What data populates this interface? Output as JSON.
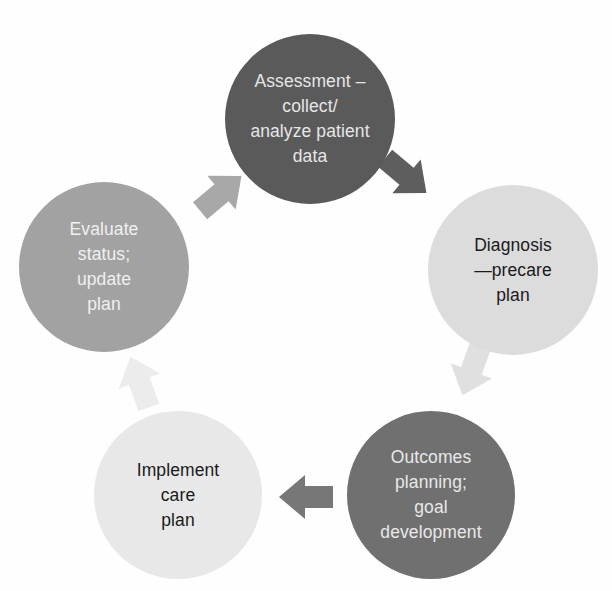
{
  "diagram": {
    "type": "cycle",
    "nodes": [
      {
        "id": "assessment",
        "lines": [
          "Assessment –",
          "collect/",
          "analyze patient",
          "data"
        ],
        "fill": "#5a5a5a",
        "text_color": "#e6e6e6",
        "cx": 310,
        "cy": 119,
        "r": 85
      },
      {
        "id": "diagnosis",
        "lines": [
          "Diagnosis",
          "—precare",
          "plan"
        ],
        "fill": "#dcdcdc",
        "text_color": "#1a1a1a",
        "cx": 513,
        "cy": 270,
        "r": 85
      },
      {
        "id": "outcomes",
        "lines": [
          "Outcomes",
          "planning;",
          "goal",
          "development"
        ],
        "fill": "#707070",
        "text_color": "#e8e8e8",
        "cx": 431,
        "cy": 495,
        "r": 84
      },
      {
        "id": "implement",
        "lines": [
          "Implement",
          "care",
          "plan"
        ],
        "fill": "#e8e8e8",
        "text_color": "#1a1a1a",
        "cx": 178,
        "cy": 495,
        "r": 84
      },
      {
        "id": "evaluate",
        "lines": [
          "Evaluate",
          "status;",
          "update",
          "plan"
        ],
        "fill": "#a2a2a2",
        "text_color": "#f0f0f0",
        "cx": 104,
        "cy": 267,
        "r": 85
      }
    ],
    "arrows": [
      {
        "id": "assessment-to-diagnosis",
        "from": "assessment",
        "to": "diagnosis",
        "fill": "#5e5e5e",
        "cx": 405,
        "cy": 175,
        "angle": 40
      },
      {
        "id": "diagnosis-to-outcomes",
        "from": "diagnosis",
        "to": "outcomes",
        "fill": "#e0e0e0",
        "cx": 472,
        "cy": 369,
        "angle": 110
      },
      {
        "id": "outcomes-to-implement",
        "from": "outcomes",
        "to": "implement",
        "fill": "#777777",
        "cx": 307,
        "cy": 497,
        "angle": 180
      },
      {
        "id": "implement-to-evaluate",
        "from": "implement",
        "to": "evaluate",
        "fill": "#ececec",
        "cx": 140,
        "cy": 383,
        "angle": -110
      },
      {
        "id": "evaluate-to-assessment",
        "from": "evaluate",
        "to": "assessment",
        "fill": "#a8a8a8",
        "cx": 220,
        "cy": 194,
        "angle": -40
      }
    ]
  }
}
